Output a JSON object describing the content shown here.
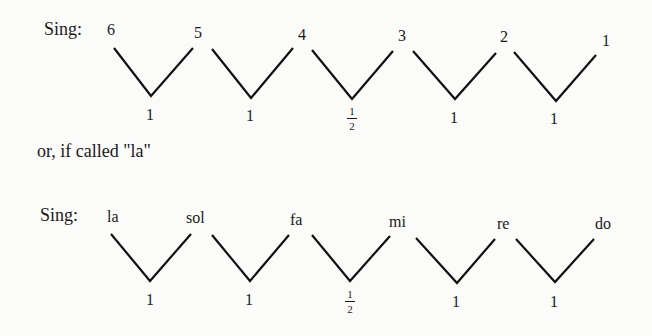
{
  "diagram_numbers": {
    "prefix": "Sing:",
    "degrees": [
      "6",
      "5",
      "4",
      "3",
      "2",
      "1"
    ],
    "intervals": [
      "1",
      "1",
      "1/2",
      "1",
      "1"
    ],
    "half": {
      "num": "1",
      "den": "2"
    }
  },
  "connector": "or, if called \"la\"",
  "diagram_syllables": {
    "prefix": "Sing:",
    "syllables": [
      "la",
      "sol",
      "fa",
      "mi",
      "re",
      "do"
    ],
    "intervals": [
      "1",
      "1",
      "1/2",
      "1",
      "1"
    ],
    "half": {
      "num": "1",
      "den": "2"
    }
  }
}
